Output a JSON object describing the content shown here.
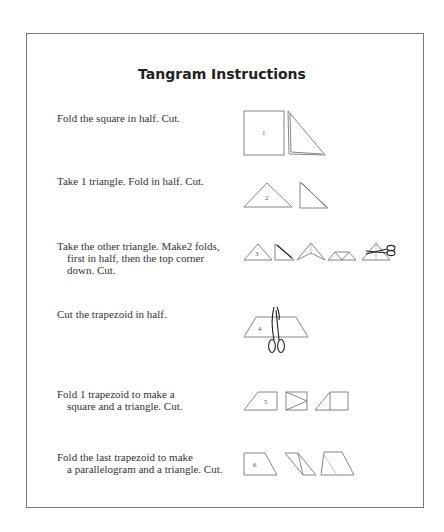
{
  "document": {
    "title": "Tangram Instructions",
    "steps": [
      {
        "lines": [
          "Fold the square in half. Cut."
        ],
        "piece_label": "1",
        "diagram": [
          "square-numbered",
          "folded-right-triangle"
        ]
      },
      {
        "lines": [
          "Take 1 triangle. Fold in half. Cut."
        ],
        "piece_label": "2",
        "diagram": [
          "triangle-numbered",
          "folded-right-triangle"
        ]
      },
      {
        "lines": [
          "Take the other triangle. Make2 folds,",
          "first in half, then the top corner",
          "down. Cut."
        ],
        "piece_label": "3",
        "diagram": [
          "triangle-numbered",
          "folded-right-triangle",
          "triangle-folded-center",
          "triangle-corner-folded",
          "triangle-with-scissors"
        ]
      },
      {
        "lines": [
          "Cut the trapezoid in half."
        ],
        "piece_label": "4",
        "diagram": [
          "trapezoid-with-scissors"
        ]
      },
      {
        "lines": [
          "Fold 1 trapezoid to make a",
          "square and a triangle. Cut."
        ],
        "piece_label": "5",
        "diagram": [
          "trapezoid-numbered",
          "square-with-triangle-fold",
          "triangle-and-square"
        ]
      },
      {
        "lines": [
          "Fold the last trapezoid to make",
          "a parallelogram and a triangle. Cut."
        ],
        "piece_label": "6",
        "diagram": [
          "trapezoid-numbered",
          "parallelogram-folded",
          "trapezoid-with-fold"
        ]
      }
    ]
  },
  "colors": {
    "border": "#7a7a7a",
    "line": "#777777",
    "text": "#333333"
  }
}
